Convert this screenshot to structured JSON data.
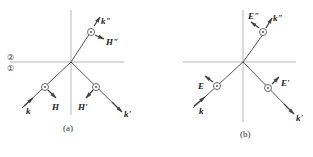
{
  "figure_a": {
    "caption": "(a)",
    "region_upper": "②",
    "region_lower": "①",
    "labels": {
      "k": "k",
      "H": "H",
      "H_prime": "H'",
      "k_prime": "k'",
      "k_double": "k\"",
      "H_double": "H\""
    }
  },
  "figure_b": {
    "caption": "(b)",
    "labels": {
      "k": "k",
      "E": "E",
      "E_prime": "E'",
      "k_prime": "k'",
      "k_double": "k\"",
      "E_double": "E\""
    }
  },
  "colors": {
    "line": "#555555",
    "axis": "#999999",
    "text": "#222222"
  }
}
